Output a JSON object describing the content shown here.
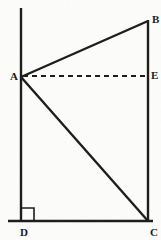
{
  "figure": {
    "kind": "geometry-diagram",
    "canvas": {
      "width": 161,
      "height": 240,
      "background": "#fdfdfb"
    },
    "stroke_color": "#1a1a1a",
    "label_color": "#1b1b1b",
    "points": [
      {
        "id": "A",
        "label": "A",
        "x": 21,
        "y": 77,
        "label_x": 10,
        "label_y": 71
      },
      {
        "id": "B",
        "label": "B",
        "x": 148,
        "y": 21,
        "label_x": 152,
        "label_y": 14
      },
      {
        "id": "E",
        "label": "E",
        "x": 148,
        "y": 76,
        "label_x": 151,
        "label_y": 70
      },
      {
        "id": "C",
        "label": "C",
        "x": 148,
        "y": 221,
        "label_x": 150,
        "label_y": 227
      },
      {
        "id": "D",
        "label": "D",
        "x": 21,
        "y": 221,
        "label_x": 20,
        "label_y": 227
      }
    ],
    "segments": [
      {
        "id": "left-vertical",
        "from": "top-of-left-line",
        "to": "D",
        "x1": 21,
        "y1": 8,
        "x2": 21,
        "y2": 222,
        "style": "solid",
        "width": 2.4
      },
      {
        "id": "right-vertical",
        "from": "B",
        "to": "C",
        "x1": 148,
        "y1": 20,
        "x2": 148,
        "y2": 222,
        "style": "solid",
        "width": 2.4
      },
      {
        "id": "base-horizontal",
        "from": "base-left",
        "to": "base-right",
        "x1": 8,
        "y1": 221,
        "x2": 153,
        "y2": 221,
        "style": "solid",
        "width": 2.4
      },
      {
        "id": "segment-AB",
        "from": "A",
        "to": "B",
        "x1": 21,
        "y1": 77,
        "x2": 148,
        "y2": 21,
        "style": "solid",
        "width": 2.4
      },
      {
        "id": "segment-AC",
        "from": "A",
        "to": "C",
        "x1": 21,
        "y1": 77,
        "x2": 148,
        "y2": 221,
        "style": "solid",
        "width": 2.4
      },
      {
        "id": "segment-AE",
        "from": "A",
        "to": "E",
        "x1": 23,
        "y1": 76,
        "x2": 147,
        "y2": 76,
        "style": "dashed",
        "width": 1.8,
        "dash": "5 4"
      }
    ],
    "right_angle_marker": {
      "at": "D",
      "x": 21,
      "y": 221,
      "size": 13,
      "direction": "up-right",
      "width": 1.6
    }
  }
}
